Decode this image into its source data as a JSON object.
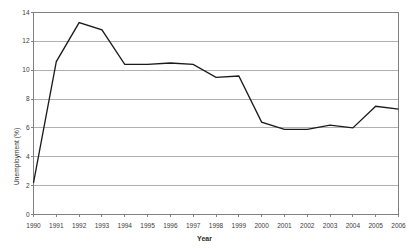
{
  "chart_data": {
    "type": "line",
    "title": "",
    "xlabel": "Year",
    "ylabel": "Unemployment (%)",
    "categories": [
      "1990",
      "1991",
      "1992",
      "1993",
      "1994",
      "1995",
      "1996",
      "1997",
      "1998",
      "1999",
      "2000",
      "2001",
      "2002",
      "2003",
      "2004",
      "2005",
      "2006"
    ],
    "values": [
      2.2,
      10.6,
      13.3,
      12.8,
      10.4,
      10.4,
      10.5,
      10.4,
      9.5,
      9.6,
      6.4,
      5.9,
      5.9,
      6.2,
      6.0,
      7.5,
      7.3
    ],
    "xlim": [
      1990,
      2006
    ],
    "ylim": [
      0,
      14
    ],
    "yticks": [
      "0",
      "2",
      "4",
      "6",
      "8",
      "10",
      "12",
      "14"
    ],
    "ytick_values": [
      0,
      2,
      4,
      6,
      8,
      10,
      12,
      14
    ],
    "grid": "horizontal",
    "legend": "none",
    "line_color": "#1a1a1a",
    "grid_color": "#b0b0b0",
    "axis_color": "#808080",
    "background_color": "#ffffff",
    "series": [
      {
        "name": "Unemployment (%)",
        "values": [
          2.2,
          10.6,
          13.3,
          12.8,
          10.4,
          10.4,
          10.5,
          10.4,
          9.5,
          9.6,
          6.4,
          5.9,
          5.9,
          6.2,
          6.0,
          7.5,
          7.3
        ]
      }
    ]
  }
}
